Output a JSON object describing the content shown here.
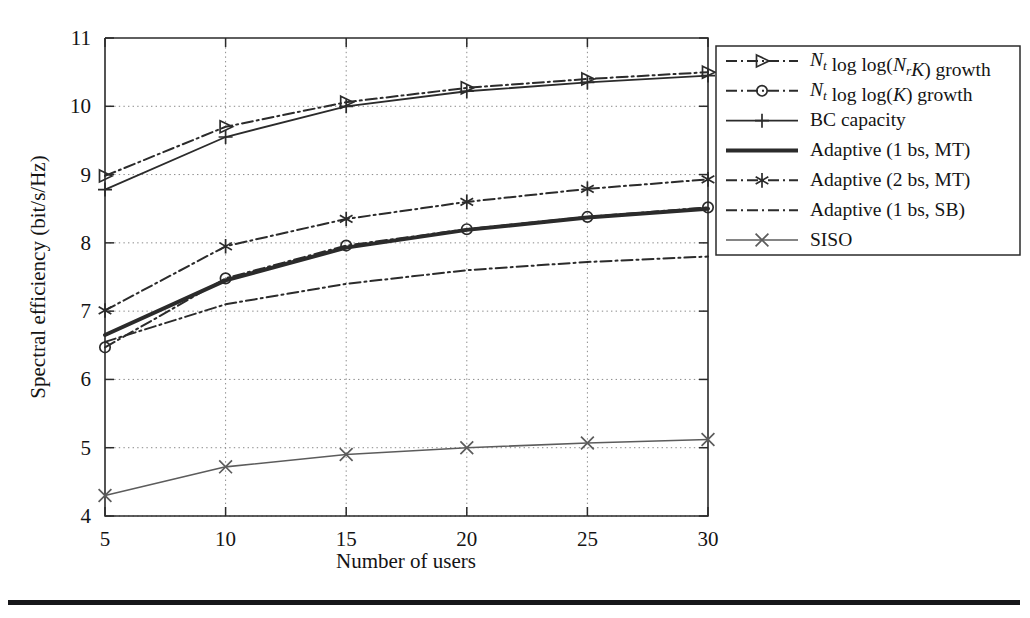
{
  "figure": {
    "bottom_rule": true
  },
  "chart_data": {
    "type": "line",
    "title": "",
    "xlabel": "Number of users",
    "ylabel": "Spectral efficiency (bit/s/Hz)",
    "x": [
      5,
      10,
      15,
      20,
      25,
      30
    ],
    "xlim": [
      5,
      30
    ],
    "ylim": [
      4,
      11
    ],
    "xticks": [
      "5",
      "10",
      "15",
      "20",
      "25",
      "30"
    ],
    "yticks": [
      "4",
      "5",
      "6",
      "7",
      "8",
      "9",
      "10",
      "11"
    ],
    "grid": true,
    "legend_position": "right-outside",
    "series": [
      {
        "name": "Nt log log(NrK) growth",
        "label_parts": [
          "N",
          "t",
          " log log(",
          "N",
          "r",
          "K",
          ") growth"
        ],
        "marker": "triangle-right",
        "linestyle": "dashdot",
        "color": "#2b2b2b",
        "values": [
          8.98,
          9.7,
          10.06,
          10.27,
          10.4,
          10.5
        ]
      },
      {
        "name": "Nt log log(K) growth",
        "marker": "circle",
        "linestyle": "dashdot",
        "color": "#2b2b2b",
        "values": [
          6.47,
          7.48,
          7.96,
          8.2,
          8.38,
          8.52
        ]
      },
      {
        "name": "BC capacity",
        "marker": "plus",
        "linestyle": "solid",
        "color": "#2b2b2b",
        "values": [
          8.78,
          9.55,
          10.0,
          10.22,
          10.35,
          10.45
        ]
      },
      {
        "name": "Adaptive (1 bs, MT)",
        "marker": "none",
        "linestyle": "solid-thick",
        "color": "#2b2b2b",
        "values": [
          6.65,
          7.45,
          7.93,
          8.19,
          8.37,
          8.5
        ]
      },
      {
        "name": "Adaptive (2 bs, MT)",
        "marker": "asterisk",
        "linestyle": "dashdot",
        "color": "#2b2b2b",
        "values": [
          7.01,
          7.95,
          8.35,
          8.6,
          8.79,
          8.93
        ]
      },
      {
        "name": "Adaptive (1 bs, SB)",
        "marker": "none",
        "linestyle": "dashdot",
        "color": "#2b2b2b",
        "values": [
          6.55,
          7.1,
          7.4,
          7.6,
          7.72,
          7.8
        ]
      },
      {
        "name": "SISO",
        "marker": "x-cross",
        "linestyle": "solid-thin",
        "color": "#5c5c5c",
        "values": [
          4.3,
          4.72,
          4.9,
          5.0,
          5.07,
          5.12
        ]
      }
    ]
  },
  "legend": {
    "entries": [
      {
        "label": "Nt log log(NrK) growth",
        "marker": "triangle-right",
        "linestyle": "dashdot"
      },
      {
        "label": "Nt log log(K) growth",
        "marker": "circle",
        "linestyle": "dashdot"
      },
      {
        "label": "BC capacity",
        "marker": "plus",
        "linestyle": "solid"
      },
      {
        "label": "Adaptive (1 bs, MT)",
        "marker": "none",
        "linestyle": "solid-thick"
      },
      {
        "label": "Adaptive (2 bs, MT)",
        "marker": "asterisk",
        "linestyle": "dashdot"
      },
      {
        "label": "Adaptive (1 bs, SB)",
        "marker": "none",
        "linestyle": "dashdot"
      },
      {
        "label": "SISO",
        "marker": "x-cross",
        "linestyle": "solid-thin"
      }
    ]
  }
}
